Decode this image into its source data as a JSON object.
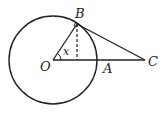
{
  "diagram": {
    "type": "geometry",
    "labels": {
      "O": "O",
      "A": "A",
      "B": "B",
      "C": "C",
      "angle": "x"
    },
    "points": {
      "O": [
        53,
        60
      ],
      "A": [
        97,
        60
      ],
      "B": [
        77,
        24
      ],
      "C": [
        145,
        60
      ]
    },
    "circle": {
      "center": "O",
      "radius": 44
    },
    "segments": [
      "OB",
      "OC",
      "BC"
    ],
    "dashed": [
      "B to foot on OA"
    ],
    "right_angle_at": "B",
    "colors": {
      "stroke": "#222222",
      "background": "#ffffff"
    }
  }
}
